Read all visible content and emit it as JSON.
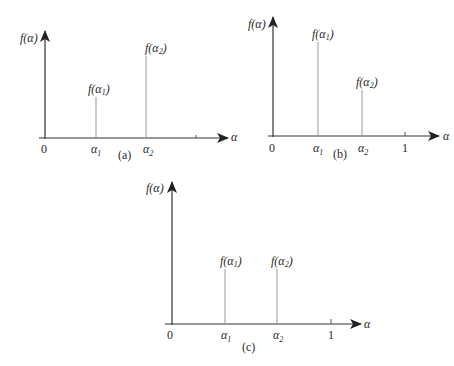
{
  "figure": {
    "panels": [
      {
        "id": "a",
        "caption": "(a)",
        "y_label": "f(α)",
        "x_label": "α",
        "origin_label": "0",
        "show_one": false,
        "stems": [
          {
            "x_label": "α",
            "x_sub": "1",
            "f_label": "f(α",
            "f_sub": "1",
            "rel_x": 0.28,
            "rel_height": 0.38
          },
          {
            "x_label": "α",
            "x_sub": "2",
            "f_label": "f(α",
            "f_sub": "2",
            "rel_x": 0.56,
            "rel_height": 0.77
          }
        ]
      },
      {
        "id": "b",
        "caption": "(b)",
        "y_label": "f(α)",
        "x_label": "α",
        "origin_label": "0",
        "one_label": "1",
        "show_one": true,
        "stems": [
          {
            "x_label": "α",
            "x_sub": "1",
            "f_label": "f(α",
            "f_sub": "1",
            "rel_x": 0.34,
            "rel_height": 0.79
          },
          {
            "x_label": "α",
            "x_sub": "2",
            "f_label": "f(α",
            "f_sub": "2",
            "rel_x": 0.67,
            "rel_height": 0.39
          }
        ]
      },
      {
        "id": "c",
        "caption": "(c)",
        "y_label": "f(α)",
        "x_label": "α",
        "origin_label": "0",
        "one_label": "1",
        "show_one": true,
        "stems": [
          {
            "x_label": "α",
            "x_sub": "1",
            "f_label": "f(α",
            "f_sub": "1",
            "rel_x": 0.33,
            "rel_height": 0.39
          },
          {
            "x_label": "α",
            "x_sub": "2",
            "f_label": "f(α",
            "f_sub": "2",
            "rel_x": 0.66,
            "rel_height": 0.39
          }
        ]
      }
    ]
  }
}
